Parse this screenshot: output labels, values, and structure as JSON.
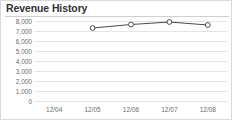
{
  "widget": {
    "title": "Revenue History",
    "background_color": "#ffffff",
    "border_color": "#d9d9d9"
  },
  "chart_data": {
    "type": "line",
    "title": "Revenue History",
    "xlabel": "",
    "ylabel": "",
    "categories": [
      "12/04",
      "12/05",
      "12/06",
      "12/07",
      "12/08"
    ],
    "series": [
      {
        "name": "Revenue",
        "values": [
          null,
          7300,
          7650,
          7900,
          7600
        ]
      }
    ],
    "ylim": [
      0,
      8000
    ],
    "y_ticks": [
      0,
      1000,
      2000,
      3000,
      4000,
      5000,
      6000,
      7000,
      8000
    ],
    "y_tick_labels": [
      "0",
      "1,000",
      "2,000",
      "3,000",
      "4,000",
      "5,000",
      "6,000",
      "7,000",
      "8,000"
    ],
    "x_tick_labels": [
      "12/04",
      "12/05",
      "12/06",
      "12/07",
      "12/08"
    ],
    "grid": true,
    "grid_axis": "y",
    "grid_color": "#e4e4e4",
    "legend": false,
    "legend_position": "none",
    "line_color": "#4a4a4a",
    "marker_shape": "circle",
    "marker_fill": "#ffffff",
    "marker_edge_color": "#4a4a4a",
    "axis_label_color": "#6a6a6a"
  }
}
